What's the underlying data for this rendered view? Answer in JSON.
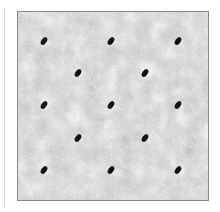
{
  "image": {
    "description": "Grayscale micrograph with mottled texture and a lattice of dark elliptical spots",
    "colors": {
      "background": "#d2d2d2",
      "spot": "#111111",
      "border": "#8a8a8a"
    },
    "spots": [
      {
        "x": 26,
        "y": 29
      },
      {
        "x": 93,
        "y": 29
      },
      {
        "x": 160,
        "y": 29
      },
      {
        "x": 60,
        "y": 61
      },
      {
        "x": 127,
        "y": 61
      },
      {
        "x": 26,
        "y": 93
      },
      {
        "x": 93,
        "y": 93
      },
      {
        "x": 160,
        "y": 93
      },
      {
        "x": 60,
        "y": 126
      },
      {
        "x": 127,
        "y": 126
      },
      {
        "x": 26,
        "y": 158
      },
      {
        "x": 93,
        "y": 158
      },
      {
        "x": 160,
        "y": 158
      }
    ]
  }
}
